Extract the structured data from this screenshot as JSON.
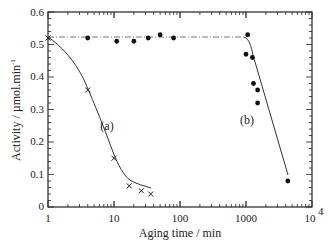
{
  "chart_data": {
    "type": "scatter",
    "title": "",
    "xlabel": "Aging time / min",
    "ylabel": "Activity / µmol.min⁻¹",
    "xscale": "log",
    "xlim": [
      1,
      10000
    ],
    "ylim": [
      0,
      0.6
    ],
    "x_tick_labels": [
      "1",
      "10",
      "100",
      "1000",
      "10⁴"
    ],
    "y_tick_labels": [
      "0",
      "0.1",
      "0.2",
      "0.3",
      "0.4",
      "0.5",
      "0.6"
    ],
    "grid": false,
    "legend": "none",
    "annotations": [
      "(a)",
      "(b)"
    ],
    "series": [
      {
        "name": "(a)",
        "marker": "x",
        "line": "solid fit",
        "x": [
          1,
          4,
          10,
          17,
          26,
          36
        ],
        "y": [
          0.52,
          0.36,
          0.15,
          0.065,
          0.05,
          0.04
        ]
      },
      {
        "name": "(b)",
        "marker": "filled-circle",
        "line": "dashed plateau then solid decline",
        "x": [
          1,
          4,
          11,
          20,
          33,
          50,
          80,
          1060,
          1000,
          1250,
          1300,
          1500,
          1500,
          4300
        ],
        "y": [
          0.52,
          0.52,
          0.51,
          0.51,
          0.52,
          0.53,
          0.52,
          0.53,
          0.47,
          0.46,
          0.38,
          0.36,
          0.32,
          0.08
        ]
      }
    ]
  },
  "labels": {
    "xlabel": "Aging time / min",
    "ylabel": "Activity / µmol.min",
    "ylabel_sup": "-1",
    "annot_a": "(a)",
    "annot_b": "(b)",
    "x_ticks": [
      "1",
      "10",
      "100",
      "1000",
      "10"
    ],
    "x_last_sup": "4",
    "y_ticks": [
      "0",
      "0.1",
      "0.2",
      "0.3",
      "0.4",
      "0.5",
      "0.6"
    ]
  }
}
